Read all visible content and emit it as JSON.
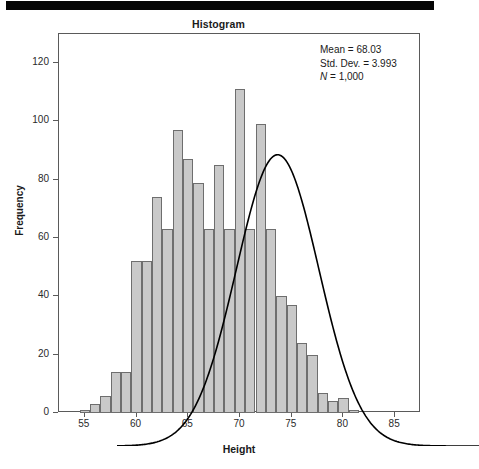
{
  "figure": {
    "title": "Histogram",
    "scan_artifact": "black-bar"
  },
  "annotation": {
    "mean_label": "Mean = 68.03",
    "stddev_label": "Std. Dev. = 3.993",
    "n_label": "N = 1,000"
  },
  "axes": {
    "x_title": "Height",
    "y_title": "Frequency",
    "x_ticks": [
      "55",
      "60",
      "65",
      "70",
      "75",
      "80",
      "85"
    ],
    "y_ticks": [
      "0",
      "20",
      "40",
      "60",
      "80",
      "100",
      "120"
    ]
  },
  "colors": {
    "bar_fill": "#c9c9c9",
    "bar_border": "#6e6e6e",
    "curve": "#000000",
    "frame": "#5a5a5a",
    "text": "#1a1a1a"
  },
  "chart_data": {
    "type": "bar",
    "title": "Histogram",
    "xlabel": "Height",
    "ylabel": "Frequency",
    "xlim": [
      52.5,
      87.5
    ],
    "ylim": [
      0,
      130
    ],
    "grid": false,
    "legend": null,
    "bin_width": 1,
    "statistics": {
      "mean": 68.03,
      "std_dev": 3.993,
      "n": 1000
    },
    "overlay": {
      "type": "normal-curve",
      "mean": 68.03,
      "std_dev": 3.993,
      "n": 1000,
      "bin_width": 1
    },
    "categories": [
      "55",
      "56",
      "57",
      "58",
      "59",
      "60",
      "61",
      "62",
      "63",
      "64",
      "65",
      "66",
      "67",
      "68",
      "69",
      "70",
      "71",
      "72",
      "73",
      "74",
      "75",
      "76",
      "77",
      "78",
      "79",
      "80",
      "81"
    ],
    "x": [
      55,
      56,
      57,
      58,
      59,
      60,
      61,
      62,
      63,
      64,
      65,
      66,
      67,
      68,
      69,
      70,
      71,
      72,
      73,
      74,
      75,
      76,
      77,
      78,
      79,
      80,
      81
    ],
    "values": [
      1,
      3,
      6,
      14,
      14,
      52,
      52,
      74,
      63,
      97,
      87,
      79,
      63,
      85,
      63,
      111,
      63,
      99,
      63,
      40,
      37,
      24,
      20,
      7,
      4,
      5,
      1
    ]
  }
}
